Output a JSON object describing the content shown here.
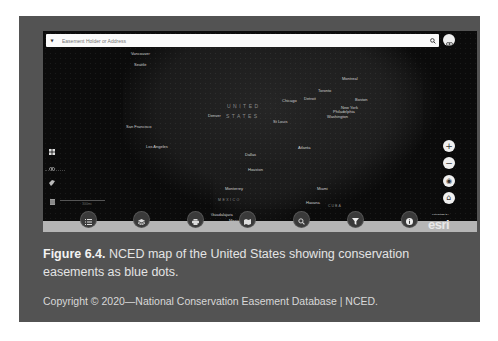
{
  "map": {
    "search": {
      "placeholder": "Easement Holder or Address",
      "dropdown_icon": "caret-down-icon",
      "search_icon": "search-icon"
    },
    "share_button_icon": "link-icon",
    "country_labels": {
      "usa_line1": "UNITED",
      "usa_line2": "STATES",
      "mexico": "MEXICO",
      "cuba": "CUBA"
    },
    "cities": [
      {
        "name": "Vancouver",
        "x": 131,
        "y": 52
      },
      {
        "name": "Seattle",
        "x": 133,
        "y": 63
      },
      {
        "name": "San Francisco",
        "x": 126,
        "y": 125
      },
      {
        "name": "Los Angeles",
        "x": 145,
        "y": 145
      },
      {
        "name": "Denver",
        "x": 208,
        "y": 114
      },
      {
        "name": "Chicago",
        "x": 282,
        "y": 99
      },
      {
        "name": "Detroit",
        "x": 304,
        "y": 97
      },
      {
        "name": "Toronto",
        "x": 318,
        "y": 89
      },
      {
        "name": "Montreal",
        "x": 342,
        "y": 77
      },
      {
        "name": "Boston",
        "x": 355,
        "y": 97
      },
      {
        "name": "New York",
        "x": 341,
        "y": 106
      },
      {
        "name": "Philadelphia",
        "x": 333,
        "y": 110
      },
      {
        "name": "Washington",
        "x": 327,
        "y": 115
      },
      {
        "name": "St Louis",
        "x": 273,
        "y": 119
      },
      {
        "name": "Atlanta",
        "x": 298,
        "y": 146
      },
      {
        "name": "Dallas",
        "x": 245,
        "y": 153
      },
      {
        "name": "Houston",
        "x": 248,
        "y": 168
      },
      {
        "name": "Monterrey",
        "x": 225,
        "y": 187
      },
      {
        "name": "Miami",
        "x": 317,
        "y": 187
      },
      {
        "name": "Havana",
        "x": 306,
        "y": 201
      },
      {
        "name": "Guadalajara",
        "x": 211,
        "y": 213
      },
      {
        "name": "Mexico",
        "x": 228,
        "y": 219
      }
    ],
    "left_controls": [
      {
        "name": "basemap-gallery",
        "icon": "grid-icon"
      },
      {
        "name": "visibility",
        "icon": "eye-icon"
      },
      {
        "name": "measure",
        "icon": "ruler-icon"
      },
      {
        "name": "table",
        "icon": "table-icon"
      }
    ],
    "scale_label": "300mi",
    "right_controls": [
      {
        "name": "zoom-in",
        "icon": "plus-icon",
        "glyph": "+"
      },
      {
        "name": "zoom-out",
        "icon": "minus-icon",
        "glyph": "−"
      },
      {
        "name": "locate",
        "icon": "locate-icon",
        "glyph": "◉"
      },
      {
        "name": "home",
        "icon": "home-icon",
        "glyph": "⌂"
      }
    ],
    "toolbar": [
      {
        "name": "legend",
        "icon": "list-icon"
      },
      {
        "name": "layers",
        "icon": "layers-icon"
      },
      {
        "name": "print",
        "icon": "print-icon"
      },
      {
        "name": "basemap",
        "icon": "map-icon"
      },
      {
        "name": "query",
        "icon": "search-zoom-icon"
      },
      {
        "name": "filter",
        "icon": "filter-icon"
      },
      {
        "name": "about",
        "icon": "info-icon"
      }
    ],
    "attribution": {
      "powered_by": "POWERED BY",
      "logo": "esri"
    }
  },
  "caption": {
    "figure_label": "Figure 6.4.",
    "text": " NCED map of the United States showing conservation easements as blue dots."
  },
  "copyright": "Copyright © 2020—National Conservation Easement Database | NCED."
}
